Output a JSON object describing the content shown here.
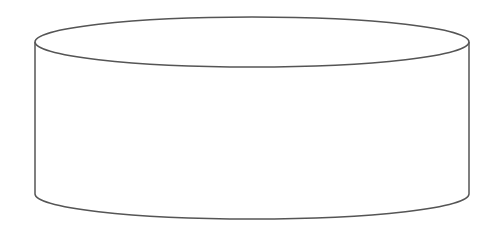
{
  "diagram": {
    "shape": "cylinder",
    "stroke_color": "#555555",
    "fill_color": "#ffffff",
    "label": ""
  }
}
